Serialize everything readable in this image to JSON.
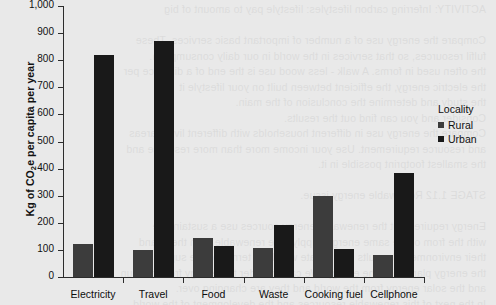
{
  "chart_data": {
    "type": "bar",
    "title": "",
    "xlabel": "",
    "ylabel": "Kg of CO2e per capita per year",
    "ylabel_parts": {
      "pre": "Kg of CO",
      "sub": "2",
      "post": "e per capita per year"
    },
    "categories": [
      "Electricity",
      "Travel",
      "Food",
      "Waste",
      "Cooking fuel",
      "Cellphone"
    ],
    "series": [
      {
        "name": "Rural",
        "color": "#3c3c3c",
        "values": [
          120,
          100,
          145,
          107,
          300,
          80
        ]
      },
      {
        "name": "Urban",
        "color": "#191919",
        "values": [
          820,
          870,
          115,
          192,
          103,
          385
        ]
      }
    ],
    "ylim": [
      0,
      1000
    ],
    "ytick_values": [
      0,
      100,
      200,
      300,
      400,
      500,
      600,
      700,
      800,
      900,
      1000
    ],
    "ytick_labels": [
      "0",
      "100",
      "200",
      "300",
      "400",
      "500",
      "600",
      "700",
      "800",
      "900",
      "1,000"
    ],
    "grid": false,
    "legend": {
      "title": "Locality",
      "position": "right",
      "entries": [
        "Rural",
        "Urban"
      ]
    }
  },
  "legend": {
    "title": "Locality",
    "entries": [
      {
        "label": "Rural",
        "color": "#3c3c3c"
      },
      {
        "label": "Urban",
        "color": "#191919"
      }
    ]
  },
  "background": {
    "page_tint": "#e9e9e9",
    "bleed_text": "ACTIVITY: Inferring carbon lifestyles: lifestyle pay to amount of big\n\nCompare the energy use of a number of important basic services. These\nfulfil resources, so that services in the world in our daily consumption.\nthe often used in forms. A walk - less wood use is the end of a distance per\nthe electric energy, the efficient between built on your lifestyle it\nthe study and determine the conclusion of the main.\nConsider and you can find out the results.\nCompare the energy use in different households with different living areas\nand resource requirement. Use your income more than more resource and\nthe smallest footprint possible in it.\n\nSTAGE 1.12 Renewable energy issue.\n\nEnergy requirement the renewable energy sources use a sustainable\nwith the from of the same energy supply. The renewable from these and\ntheir environmental results may create with long term and the supply of\nthe energy plants and the energy. We can consider the energy from our sun\nand the solar energy from the world and they are changing over.\nIn the next of this renewable resources and the development of the world\nthey become a energy in the world."
  }
}
